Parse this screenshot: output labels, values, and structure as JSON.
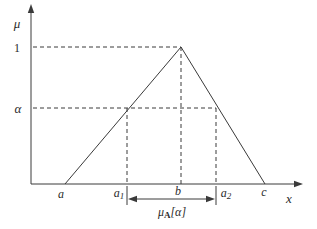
{
  "figure": {
    "colors": {
      "line": "#3a3a3a",
      "text": "#2b2b2b",
      "background": "#ffffff"
    },
    "axes": {
      "y_label": "μ",
      "x_label": "x"
    },
    "ticks": {
      "one": "1",
      "alpha": "α"
    },
    "points": {
      "a": {
        "base": "a",
        "sub": ""
      },
      "a1": {
        "base": "a",
        "sub": "1"
      },
      "b": {
        "base": "b",
        "sub": ""
      },
      "a2": {
        "base": "a",
        "sub": "2"
      },
      "c": {
        "base": "c",
        "sub": ""
      }
    },
    "interval_label": {
      "base": "μ",
      "sub": "A",
      "rest": "[α]"
    }
  }
}
